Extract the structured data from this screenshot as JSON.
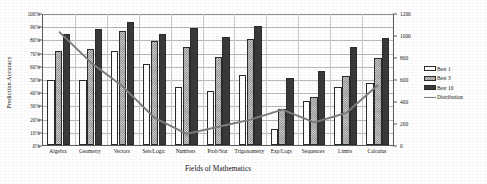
{
  "chart_data": {
    "type": "bar",
    "title": "",
    "xlabel": "Fields of Mathematics",
    "ylabel": "Prediction Accuracy",
    "ylabel_right": "",
    "categories": [
      "Algebra",
      "Geometry",
      "Vectors",
      "Sets/Logic",
      "Numbers",
      "Prob/Stat",
      "Trigonometry",
      "Exp/Logs",
      "Sequences",
      "Limits",
      "Calculus"
    ],
    "series": [
      {
        "name": "Best 1",
        "axis": "left",
        "style": "bar-white",
        "values": [
          49,
          49,
          71,
          61,
          44,
          41,
          53,
          12,
          33,
          44,
          47
        ]
      },
      {
        "name": "Best 3",
        "axis": "left",
        "style": "bar-hatched",
        "values": [
          71,
          73,
          86,
          79,
          74,
          67,
          80,
          27,
          36,
          52,
          66
        ]
      },
      {
        "name": "Best 10",
        "axis": "left",
        "style": "bar-dark",
        "values": [
          84,
          88,
          93,
          84,
          89,
          82,
          90,
          51,
          56,
          74,
          81
        ]
      },
      {
        "name": "Distribution",
        "axis": "right",
        "style": "line",
        "values": [
          1040,
          760,
          540,
          255,
          110,
          175,
          240,
          330,
          215,
          300,
          555
        ]
      }
    ],
    "ylim": [
      0,
      100
    ],
    "yticks": [
      "0%",
      "10%",
      "20%",
      "30%",
      "40%",
      "50%",
      "60%",
      "70%",
      "80%",
      "90%",
      "100%"
    ],
    "ylim_right": [
      0,
      1200
    ],
    "yticks_right": [
      "0",
      "200",
      "400",
      "600",
      "800",
      "1000",
      "1200"
    ],
    "grid": true,
    "legend_position": "right",
    "legend": [
      "Best 1",
      "Best 3",
      "Best 10",
      "Distribution"
    ],
    "colors": {
      "best1": "#ffffff",
      "best3": "#8c8c8c",
      "best10": "#3a3a3a",
      "distribution": "#7d7d7d",
      "axis": "#5a5a5a",
      "grid": "#b9b9b9"
    }
  }
}
